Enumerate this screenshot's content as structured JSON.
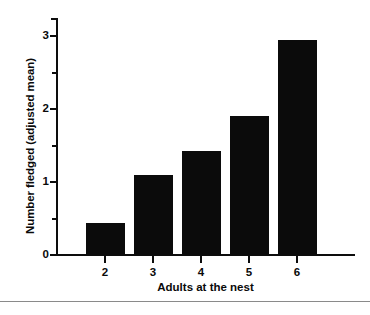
{
  "chart_data": {
    "type": "bar",
    "title": "",
    "xlabel": "Adults at the nest",
    "ylabel": "Number fledged (adjusted mean)",
    "categories": [
      "2",
      "3",
      "4",
      "5",
      "6"
    ],
    "values": [
      0.44,
      1.1,
      1.42,
      1.9,
      2.95
    ],
    "ylim": [
      0,
      3.25
    ],
    "xlim": [
      1.5,
      7.0
    ],
    "y_major_ticks": [
      0,
      1,
      2,
      3
    ],
    "y_major_tick_labels": [
      "0",
      "1",
      "2",
      "3"
    ],
    "y_minor_ticks": [
      0.5,
      1.5,
      2.5,
      3.0
    ],
    "grid": false,
    "legend": null,
    "bar_color": "#0b0b0b",
    "axis_color": "#0d0d0d"
  },
  "figure": {
    "caption_rule_color": "#8a8a8a"
  }
}
